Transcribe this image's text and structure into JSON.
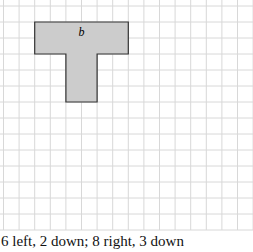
{
  "figure": {
    "grid": {
      "x0": 3.5,
      "y0": 6,
      "step_x": 15.6,
      "step_y": 16,
      "cols": 16,
      "rows": 14,
      "line_color": "#d8d8d8"
    },
    "shape": {
      "label": "b",
      "fill": "#cccccc",
      "stroke": "#333333",
      "points_grid": [
        [
          2,
          1
        ],
        [
          8,
          1
        ],
        [
          8,
          3
        ],
        [
          6,
          3
        ],
        [
          6,
          6
        ],
        [
          4,
          6
        ],
        [
          4,
          3
        ],
        [
          2,
          3
        ]
      ]
    },
    "caption": "6 left, 2 down; 8 right, 3 down"
  }
}
